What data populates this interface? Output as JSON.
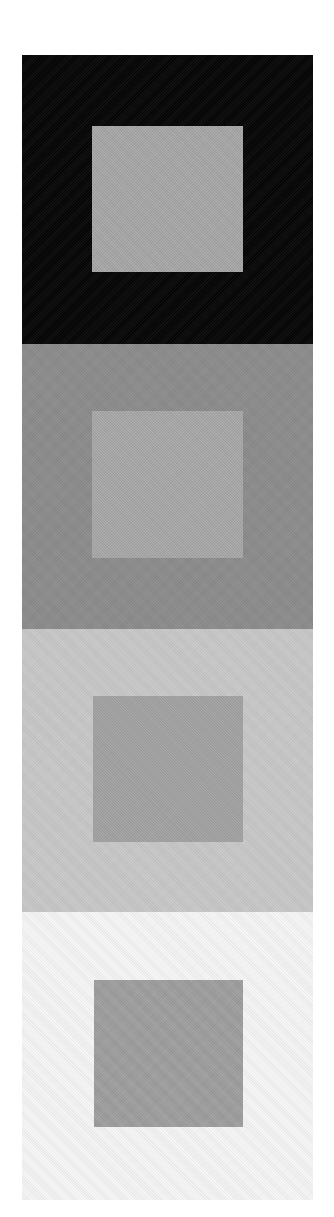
{
  "artwork": {
    "type": "color-interaction study",
    "panels": [
      {
        "name": "black-surround",
        "top": 55,
        "height": 289,
        "surround_color": "#050505",
        "inner": {
          "left": 70,
          "top": 71,
          "width": 151,
          "height": 146,
          "color": "#a9a9a9"
        }
      },
      {
        "name": "dark-gray-surround",
        "top": 344,
        "height": 285,
        "surround_color": "#8c8c8c",
        "inner": {
          "left": 70,
          "top": 67,
          "width": 151,
          "height": 147,
          "color": "#aaaaaa"
        }
      },
      {
        "name": "light-gray-surround",
        "top": 629,
        "height": 283,
        "surround_color": "#c8c8c8",
        "inner": {
          "left": 71,
          "top": 67,
          "width": 150,
          "height": 146,
          "color": "#a4a4a4"
        }
      },
      {
        "name": "white-surround",
        "top": 912,
        "height": 288,
        "surround_color": "#f6f6f6",
        "inner": {
          "left": 72,
          "top": 68,
          "width": 149,
          "height": 147,
          "color": "#a0a0a0"
        }
      }
    ]
  }
}
